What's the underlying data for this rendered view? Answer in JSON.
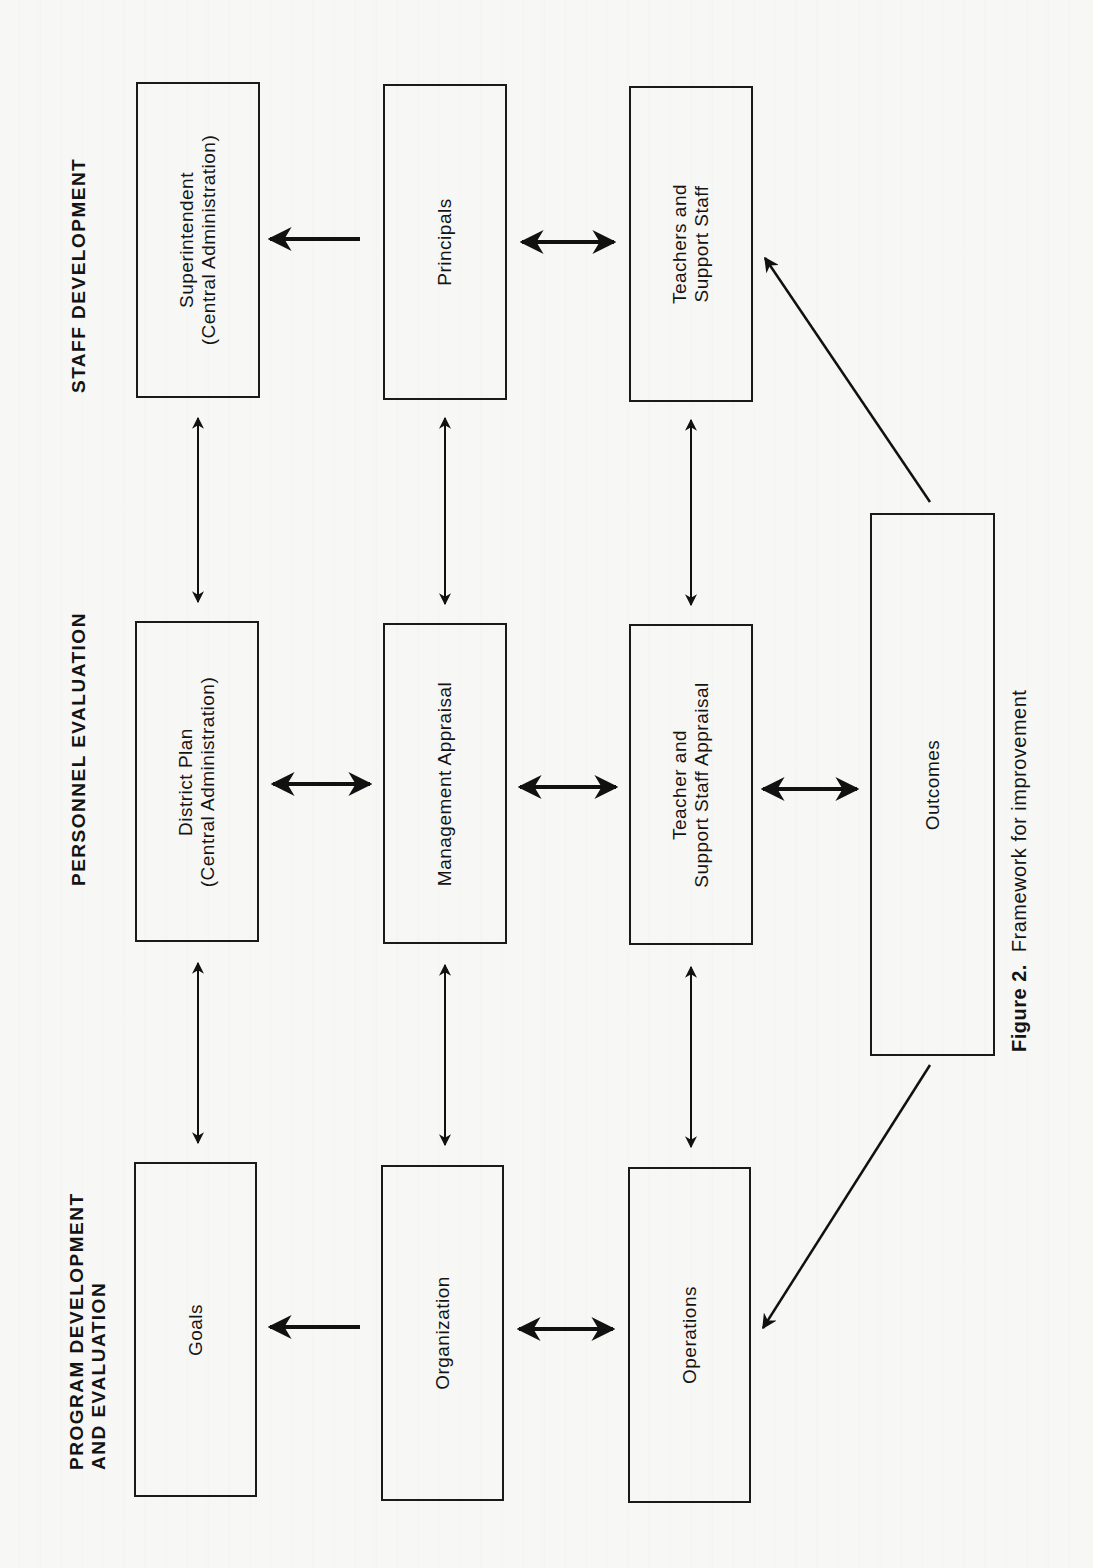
{
  "figure": {
    "number_label": "Figure 2.",
    "title": "Framework for improvement"
  },
  "sections": {
    "staff_development": {
      "label_lines": [
        "STAFF DEVELOPMENT"
      ]
    },
    "personnel_evaluation": {
      "label_lines": [
        "PERSONNEL EVALUATION"
      ]
    },
    "program_development": {
      "label_lines": [
        "PROGRAM DEVELOPMENT",
        "AND EVALUATION"
      ]
    }
  },
  "boxes": {
    "superintendent": {
      "lines": [
        "Superintendent",
        "(Central Administration)"
      ]
    },
    "principals": {
      "lines": [
        "Principals"
      ]
    },
    "teachers_support_staff": {
      "lines": [
        "Teachers and",
        "Support Staff"
      ]
    },
    "district_plan": {
      "lines": [
        "District Plan",
        "(Central Administration)"
      ]
    },
    "management_appraisal": {
      "lines": [
        "Management Appraisal"
      ]
    },
    "teacher_staff_appraisal": {
      "lines": [
        "Teacher and",
        "Support Staff Appraisal"
      ]
    },
    "outcomes": {
      "lines": [
        "Outcomes"
      ]
    },
    "goals": {
      "lines": [
        "Goals"
      ]
    },
    "organization": {
      "lines": [
        "Organization"
      ]
    },
    "operations": {
      "lines": [
        "Operations"
      ]
    }
  },
  "connections": [
    {
      "from": "principals",
      "to": "superintendent",
      "type": "one-way"
    },
    {
      "from": "principals",
      "to": "teachers_support_staff",
      "type": "two-way"
    },
    {
      "from": "superintendent",
      "to": "district_plan",
      "type": "two-way"
    },
    {
      "from": "principals",
      "to": "management_appraisal",
      "type": "two-way"
    },
    {
      "from": "teachers_support_staff",
      "to": "teacher_staff_appraisal",
      "type": "two-way"
    },
    {
      "from": "district_plan",
      "to": "management_appraisal",
      "type": "two-way"
    },
    {
      "from": "management_appraisal",
      "to": "teacher_staff_appraisal",
      "type": "two-way"
    },
    {
      "from": "teacher_staff_appraisal",
      "to": "outcomes",
      "type": "two-way"
    },
    {
      "from": "outcomes",
      "to": "teachers_support_staff",
      "type": "one-way"
    },
    {
      "from": "district_plan",
      "to": "goals",
      "type": "two-way"
    },
    {
      "from": "management_appraisal",
      "to": "organization",
      "type": "two-way"
    },
    {
      "from": "teacher_staff_appraisal",
      "to": "operations",
      "type": "two-way"
    },
    {
      "from": "organization",
      "to": "goals",
      "type": "one-way"
    },
    {
      "from": "organization",
      "to": "operations",
      "type": "two-way"
    },
    {
      "from": "outcomes",
      "to": "operations",
      "type": "one-way"
    }
  ]
}
